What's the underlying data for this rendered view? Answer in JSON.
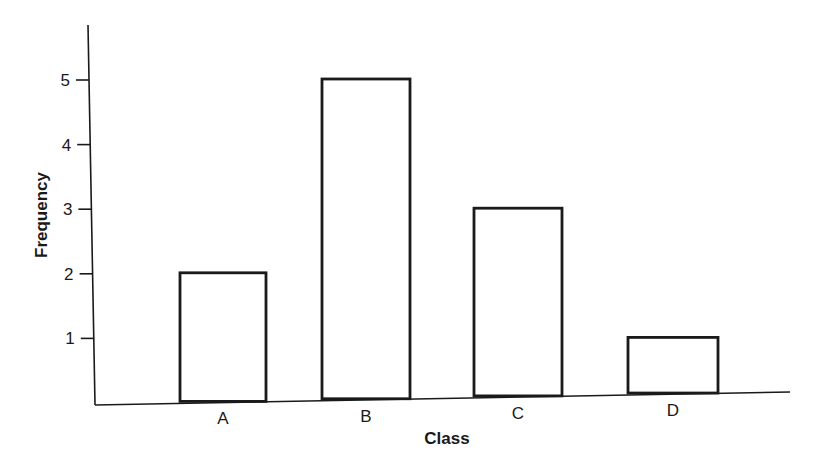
{
  "chart_data": {
    "type": "bar",
    "title": "",
    "xlabel": "Class",
    "ylabel": "Frequency",
    "categories": [
      "A",
      "B",
      "C",
      "D"
    ],
    "values": [
      2,
      5,
      3,
      1
    ],
    "yticks": [
      1,
      2,
      3,
      4,
      5
    ],
    "ylim": [
      0,
      5.8
    ],
    "grid": false,
    "legend": null,
    "colors": {
      "bar_fill": "#ffffff",
      "bar_stroke": "#1a1a1a",
      "axis": "#1a1a1a"
    }
  }
}
